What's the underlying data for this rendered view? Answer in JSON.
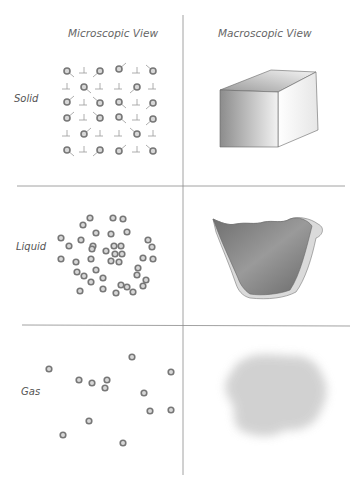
{
  "headers": {
    "microscopic": "Microscopic View",
    "macroscopic": "Macroscopic View"
  },
  "rows": [
    {
      "label": "Solid",
      "micro": "ordered lattice of particles",
      "macro": "cube"
    },
    {
      "label": "Liquid",
      "micro": "closely packed disordered particles",
      "macro": "liquid taking shape of container"
    },
    {
      "label": "Gas",
      "micro": "widely spaced particles",
      "macro": "diffuse cloud"
    }
  ],
  "colors": {
    "line": "#8a8a8a",
    "particle_ring": "#777777",
    "particle_center": "#d8d8d8",
    "text": "#555555"
  },
  "solid_atoms": [
    [
      67,
      71
    ],
    [
      100,
      71
    ],
    [
      119,
      69
    ],
    [
      153,
      71
    ],
    [
      84,
      87
    ],
    [
      137,
      87
    ],
    [
      67,
      102
    ],
    [
      100,
      103
    ],
    [
      119,
      102
    ],
    [
      153,
      103
    ],
    [
      67,
      118
    ],
    [
      100,
      118
    ],
    [
      119,
      117
    ],
    [
      153,
      119
    ],
    [
      84,
      134
    ],
    [
      137,
      134
    ],
    [
      67,
      150
    ],
    [
      100,
      150
    ],
    [
      119,
      151
    ],
    [
      153,
      151
    ]
  ],
  "solid_marks": [
    [
      84,
      71
    ],
    [
      137,
      71
    ],
    [
      67,
      87
    ],
    [
      100,
      87
    ],
    [
      119,
      87
    ],
    [
      153,
      87
    ],
    [
      84,
      103
    ],
    [
      137,
      103
    ],
    [
      84,
      118
    ],
    [
      137,
      118
    ],
    [
      67,
      134
    ],
    [
      100,
      134
    ],
    [
      119,
      134
    ],
    [
      153,
      134
    ],
    [
      84,
      150
    ],
    [
      137,
      150
    ]
  ],
  "liquid_particles": [
    [
      90,
      218
    ],
    [
      113,
      218
    ],
    [
      123,
      219
    ],
    [
      83,
      225
    ],
    [
      96,
      233
    ],
    [
      111,
      234
    ],
    [
      127,
      232
    ],
    [
      61,
      238
    ],
    [
      81,
      240
    ],
    [
      93,
      246
    ],
    [
      148,
      240
    ],
    [
      69,
      246
    ],
    [
      92,
      249
    ],
    [
      114,
      246
    ],
    [
      121,
      246
    ],
    [
      152,
      247
    ],
    [
      106,
      251
    ],
    [
      115,
      254
    ],
    [
      122,
      254
    ],
    [
      61,
      259
    ],
    [
      76,
      262
    ],
    [
      91,
      259
    ],
    [
      111,
      261
    ],
    [
      119,
      262
    ],
    [
      143,
      258
    ],
    [
      153,
      259
    ],
    [
      77,
      272
    ],
    [
      96,
      270
    ],
    [
      138,
      268
    ],
    [
      84,
      276
    ],
    [
      103,
      278
    ],
    [
      137,
      275
    ],
    [
      91,
      282
    ],
    [
      146,
      280
    ],
    [
      121,
      285
    ],
    [
      80,
      291
    ],
    [
      103,
      289
    ],
    [
      127,
      287
    ],
    [
      143,
      286
    ],
    [
      116,
      293
    ],
    [
      133,
      292
    ]
  ],
  "gas_particles": [
    [
      49,
      369
    ],
    [
      132,
      357
    ],
    [
      171,
      372
    ],
    [
      79,
      380
    ],
    [
      92,
      383
    ],
    [
      107,
      380
    ],
    [
      105,
      388
    ],
    [
      144,
      393
    ],
    [
      150,
      411
    ],
    [
      171,
      410
    ],
    [
      89,
      421
    ],
    [
      63,
      435
    ],
    [
      123,
      443
    ]
  ]
}
